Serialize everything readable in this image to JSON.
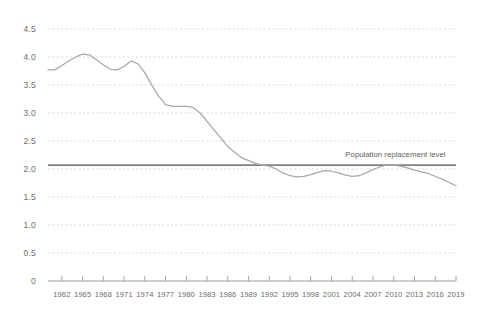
{
  "chart_data": {
    "type": "line",
    "title": "",
    "subtitle": "",
    "xlabel": "",
    "ylabel": "",
    "xlim": [
      1960,
      2019
    ],
    "ylim": [
      0,
      4.5
    ],
    "grid": true,
    "legend_position": "none",
    "y_ticks": [
      "4.5",
      "4.0",
      "3.5",
      "3.0",
      "2.5",
      "2.0",
      "1.5",
      "1.0",
      "0.5",
      "0"
    ],
    "y_tick_values": [
      4.5,
      4.0,
      3.5,
      3.0,
      2.5,
      2.0,
      1.5,
      1.0,
      0.5,
      0
    ],
    "x_ticks": [
      "1962",
      "1965",
      "1968",
      "1971",
      "1974",
      "1977",
      "1980",
      "1983",
      "1986",
      "1989",
      "1992",
      "1995",
      "1998",
      "2001",
      "2004",
      "2007",
      "2010",
      "2013",
      "2016",
      "2019"
    ],
    "x_tick_values": [
      1962,
      1965,
      1968,
      1971,
      1974,
      1977,
      1980,
      1983,
      1986,
      1989,
      1992,
      1995,
      1998,
      2001,
      2004,
      2007,
      2010,
      2013,
      2016,
      2019
    ],
    "annotations": [
      {
        "name": "replacement-level-annotation",
        "text": "Population replacement level",
        "value": 2.07,
        "x": 2003
      }
    ],
    "reference_lines": [
      {
        "name": "population-replacement-level",
        "value": 2.07,
        "style": "solid",
        "color": "#808080"
      }
    ],
    "series": [
      {
        "name": "fertility-rate",
        "color": "#a8a8a8",
        "x": [
          1960,
          1961,
          1962,
          1963,
          1964,
          1965,
          1966,
          1967,
          1968,
          1969,
          1970,
          1971,
          1972,
          1973,
          1974,
          1975,
          1976,
          1977,
          1978,
          1979,
          1980,
          1981,
          1982,
          1983,
          1984,
          1985,
          1986,
          1987,
          1988,
          1989,
          1990,
          1991,
          1992,
          1993,
          1994,
          1995,
          1996,
          1997,
          1998,
          1999,
          2000,
          2001,
          2002,
          2003,
          2004,
          2005,
          2006,
          2007,
          2008,
          2009,
          2010,
          2011,
          2012,
          2013,
          2014,
          2015,
          2016,
          2017,
          2018,
          2019
        ],
        "values": [
          3.77,
          3.77,
          3.85,
          3.93,
          4.0,
          4.05,
          4.04,
          3.95,
          3.86,
          3.78,
          3.77,
          3.83,
          3.93,
          3.88,
          3.72,
          3.5,
          3.3,
          3.15,
          3.12,
          3.12,
          3.12,
          3.1,
          3.0,
          2.85,
          2.7,
          2.55,
          2.4,
          2.3,
          2.2,
          2.15,
          2.1,
          2.07,
          2.05,
          2.0,
          1.93,
          1.88,
          1.86,
          1.87,
          1.9,
          1.94,
          1.97,
          1.96,
          1.93,
          1.89,
          1.87,
          1.88,
          1.93,
          1.99,
          2.04,
          2.07,
          2.07,
          2.05,
          2.02,
          1.98,
          1.95,
          1.92,
          1.87,
          1.82,
          1.76,
          1.7
        ]
      }
    ]
  },
  "colors": {
    "background": "#ffffff",
    "grid": "#cfcfcf",
    "axis": "#9a9a9a",
    "line": "#a8a8a8",
    "reference_line": "#7d7d7d",
    "text": "#6c6c6c"
  }
}
